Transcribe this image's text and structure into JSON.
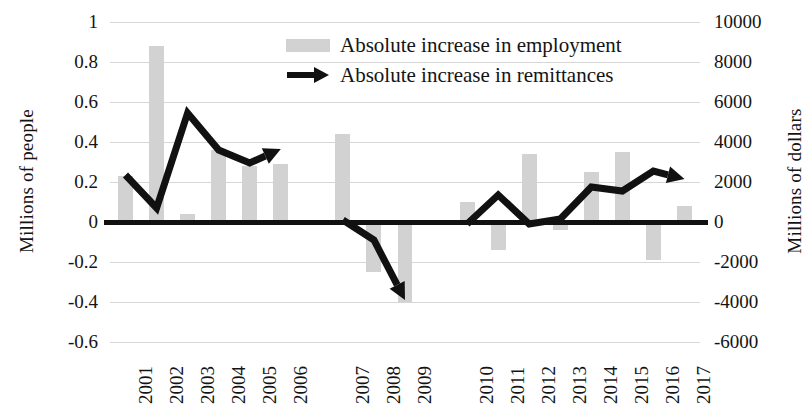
{
  "chart_data": {
    "type": "bar",
    "title": "",
    "xlabel": "",
    "categories": [
      "2001",
      "2002",
      "2003",
      "2004",
      "2005",
      "2006",
      "2007",
      "2008",
      "2009",
      "2010",
      "2011",
      "2012",
      "2013",
      "2014",
      "2015",
      "2016",
      "2017"
    ],
    "left_axis": {
      "label": "Millions of people",
      "ticks": [
        "1",
        "0.8",
        "0.6",
        "0.4",
        "0.2",
        "0",
        "-0.2",
        "-0.4",
        "-0.6"
      ],
      "tick_values": [
        1,
        0.8,
        0.6,
        0.4,
        0.2,
        0,
        -0.2,
        -0.4,
        -0.6
      ],
      "ylim": [
        -0.6,
        1
      ]
    },
    "right_axis": {
      "label": "Millions of dollars",
      "ticks": [
        "10000",
        "8000",
        "6000",
        "4000",
        "2000",
        "0",
        "-2000",
        "-4000",
        "-6000"
      ],
      "tick_values": [
        10000,
        8000,
        6000,
        4000,
        2000,
        0,
        -2000,
        -4000,
        -6000
      ],
      "ylim": [
        -6000,
        10000
      ]
    },
    "grid": true,
    "legend_position": "top-center",
    "series": [
      {
        "name": "Absolute increase in employment",
        "type": "bar",
        "axis": "left",
        "unit": "millions of people",
        "color": "#d2d2d2",
        "values": [
          0.23,
          0.88,
          0.04,
          0.36,
          0.28,
          0.29,
          0.44,
          -0.25,
          -0.4,
          0.1,
          -0.14,
          0.34,
          -0.04,
          0.25,
          0.35,
          -0.19,
          0.08
        ]
      },
      {
        "name": "Absolute increase in remittances",
        "type": "line",
        "axis": "right",
        "unit": "millions of dollars",
        "color": "#111111",
        "arrow_end": true,
        "segments": [
          {
            "years": [
              "2001",
              "2002",
              "2003",
              "2004",
              "2005",
              "2006"
            ],
            "values": [
              2350,
              700,
              5450,
              3600,
              2950,
              3650
            ]
          },
          {
            "years": [
              "2007",
              "2008",
              "2009"
            ],
            "values": [
              100,
              -900,
              -3900
            ]
          },
          {
            "years": [
              "2010",
              "2011",
              "2012",
              "2013",
              "2014",
              "2015",
              "2016",
              "2017"
            ],
            "values": [
              -100,
              1350,
              -100,
              150,
              1750,
              1550,
              2550,
              2150
            ]
          }
        ]
      }
    ]
  },
  "legend": {
    "items": [
      {
        "label": "Absolute increase in employment",
        "marker": "bar-swatch"
      },
      {
        "label": "Absolute increase in remittances",
        "marker": "arrow-line"
      }
    ]
  }
}
